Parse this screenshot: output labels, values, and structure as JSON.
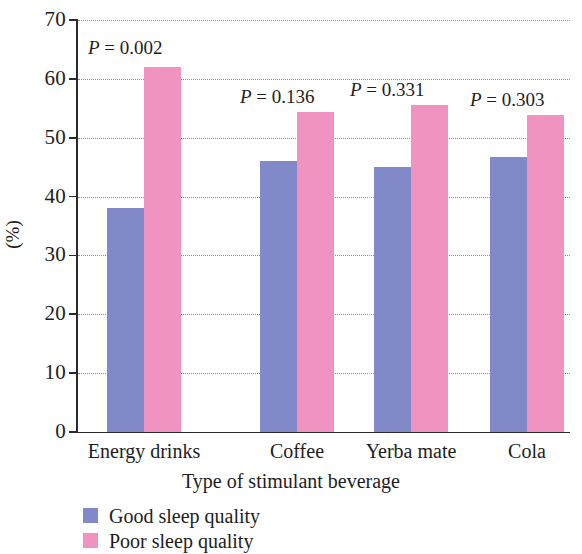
{
  "chart_data": {
    "type": "bar",
    "title": "",
    "xlabel": "Type of stimulant beverage",
    "ylabel": "(%)",
    "ylim": [
      0,
      70
    ],
    "ytick_step": 10,
    "yticks": [
      "70",
      "60",
      "50",
      "40",
      "30",
      "20",
      "10",
      "0"
    ],
    "grid": "horizontal-dotted",
    "legend_position": "bottom-left",
    "categories": [
      "Energy drinks",
      "Coffee",
      "Yerba mate",
      "Cola"
    ],
    "series": [
      {
        "name": "Good sleep quality",
        "color": "#8189c8",
        "values": [
          38.1,
          46.0,
          45.0,
          46.7
        ]
      },
      {
        "name": "Poor sleep quality",
        "color": "#f093c0",
        "values": [
          62.0,
          54.3,
          55.6,
          53.8
        ]
      }
    ],
    "annotations": [
      {
        "group": "Energy drinks",
        "label_prefix": "P",
        "label_rest": " = 0.002",
        "value": 0.002
      },
      {
        "group": "Coffee",
        "label_prefix": "P",
        "label_rest": " = 0.136",
        "value": 0.136
      },
      {
        "group": "Yerba mate",
        "label_prefix": "P",
        "label_rest": " = 0.331",
        "value": 0.331
      },
      {
        "group": "Cola",
        "label_prefix": "P",
        "label_rest": " = 0.303",
        "value": 0.303
      }
    ]
  },
  "axis": {
    "y_title": "(%)",
    "x_title": "Type of stimulant beverage"
  },
  "legend": {
    "items": [
      {
        "label": "Good sleep quality",
        "color": "#8189c8"
      },
      {
        "label": "Poor sleep quality",
        "color": "#f093c0"
      }
    ]
  }
}
